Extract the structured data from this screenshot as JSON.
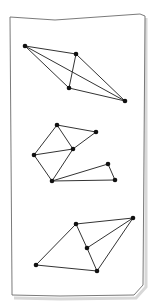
{
  "figure": {
    "paper": {
      "outline": [
        [
          10,
          17
        ],
        [
          55,
          20
        ],
        [
          140,
          14
        ],
        [
          145,
          16
        ],
        [
          143,
          285
        ],
        [
          134,
          295
        ],
        [
          60,
          296
        ],
        [
          12,
          295
        ],
        [
          12,
          290
        ],
        [
          10,
          17
        ]
      ],
      "stroke": "#6b6b6b",
      "shadow": "#d8d8d8"
    },
    "edge_color": "#333333",
    "node_color": "#111111",
    "node_radius": 2.3,
    "graphs": [
      {
        "id": "graph-1",
        "nodes": [
          {
            "id": "A",
            "x": 25,
            "y": 46
          },
          {
            "id": "B",
            "x": 76,
            "y": 54
          },
          {
            "id": "C",
            "x": 69,
            "y": 88
          },
          {
            "id": "D",
            "x": 125,
            "y": 101
          }
        ],
        "edges": [
          [
            "A",
            "B"
          ],
          [
            "A",
            "C"
          ],
          [
            "A",
            "D"
          ],
          [
            "B",
            "C"
          ],
          [
            "B",
            "D"
          ],
          [
            "C",
            "D"
          ]
        ]
      },
      {
        "id": "graph-2",
        "nodes": [
          {
            "id": "E",
            "x": 57,
            "y": 125
          },
          {
            "id": "F",
            "x": 96,
            "y": 132
          },
          {
            "id": "G",
            "x": 73,
            "y": 149
          },
          {
            "id": "H",
            "x": 34,
            "y": 155
          },
          {
            "id": "I",
            "x": 52,
            "y": 181
          },
          {
            "id": "J",
            "x": 108,
            "y": 164
          },
          {
            "id": "K",
            "x": 115,
            "y": 180
          }
        ],
        "edges": [
          [
            "E",
            "F"
          ],
          [
            "E",
            "G"
          ],
          [
            "E",
            "H"
          ],
          [
            "F",
            "G"
          ],
          [
            "G",
            "H"
          ],
          [
            "G",
            "I"
          ],
          [
            "H",
            "I"
          ],
          [
            "I",
            "J"
          ],
          [
            "I",
            "K"
          ],
          [
            "J",
            "K"
          ]
        ]
      },
      {
        "id": "graph-3",
        "nodes": [
          {
            "id": "L",
            "x": 76,
            "y": 224
          },
          {
            "id": "M",
            "x": 133,
            "y": 218
          },
          {
            "id": "N",
            "x": 87,
            "y": 248
          },
          {
            "id": "O",
            "x": 36,
            "y": 265
          },
          {
            "id": "P",
            "x": 97,
            "y": 271
          }
        ],
        "edges": [
          [
            "L",
            "M"
          ],
          [
            "L",
            "N"
          ],
          [
            "L",
            "O"
          ],
          [
            "M",
            "N"
          ],
          [
            "M",
            "P"
          ],
          [
            "N",
            "P"
          ],
          [
            "O",
            "P"
          ]
        ]
      }
    ]
  }
}
